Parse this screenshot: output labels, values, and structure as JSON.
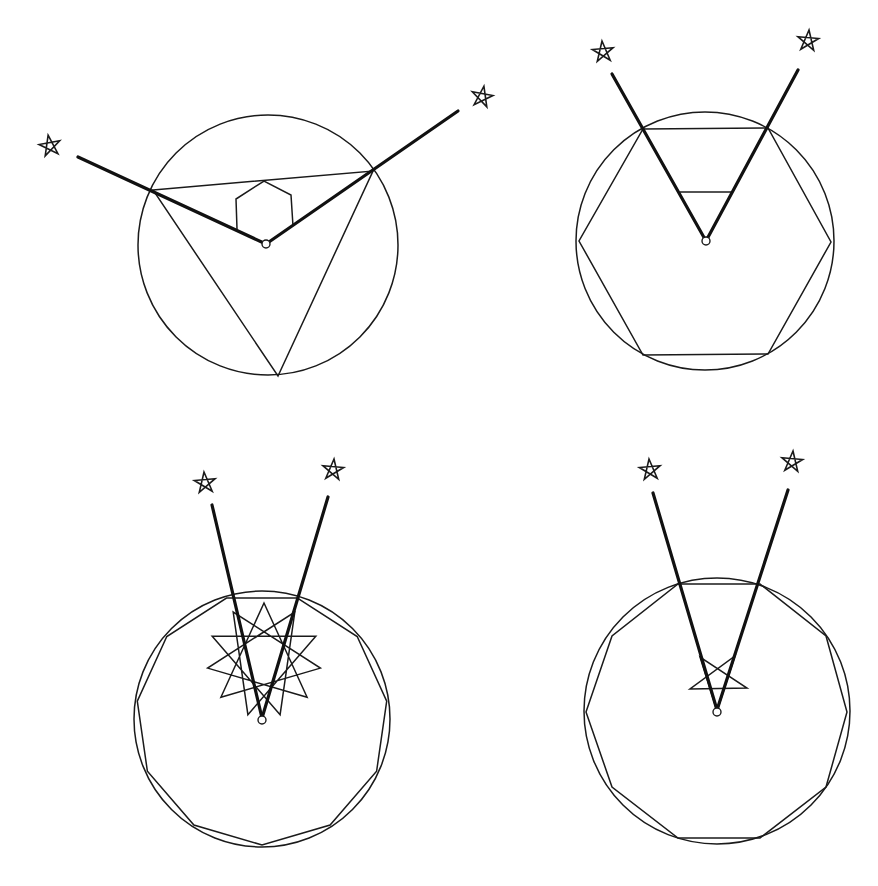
{
  "figure": {
    "colors": {
      "ink": "#1a1a1a",
      "background": "#ffffff"
    },
    "panels": [
      {
        "id": "top-left",
        "circle": {
          "cx": 268,
          "cy": 245,
          "r": 130
        },
        "inscribed_polygon": {
          "sides": 3,
          "points": [
            [
              153,
              190
            ],
            [
              373,
              171
            ],
            [
              278,
              376
            ]
          ]
        },
        "inner_figure": {
          "type": "hexagon-partial",
          "points": [
            [
              237,
              229
            ],
            [
              236,
              199
            ],
            [
              264,
              181
            ],
            [
              291,
              195
            ],
            [
              293,
              226
            ]
          ]
        },
        "center_point": {
          "cx": 266,
          "cy": 244,
          "r": 4
        },
        "rays": [
          {
            "from": [
              266,
              244
            ],
            "to": [
              78,
              157
            ]
          },
          {
            "from": [
              266,
              244
            ],
            "to": [
              458,
              111
            ]
          }
        ],
        "stars": [
          {
            "cx": 50,
            "cy": 146,
            "r": 11,
            "rotation": -100
          },
          {
            "cx": 482,
            "cy": 97,
            "r": 11,
            "rotation": -80
          }
        ]
      },
      {
        "id": "top-right",
        "circle": {
          "cx": 705,
          "cy": 241,
          "r": 129
        },
        "inscribed_polygon": {
          "sides": 6,
          "points": [
            [
              643,
              129
            ],
            [
              768,
              128
            ],
            [
              831,
              242
            ],
            [
              768,
              354
            ],
            [
              643,
              355
            ],
            [
              579,
              241
            ]
          ]
        },
        "inner_figure": {
          "type": "segment",
          "points": [
            [
              680,
              192
            ],
            [
              733,
              192
            ]
          ]
        },
        "center_point": {
          "cx": 706,
          "cy": 241,
          "r": 4
        },
        "rays": [
          {
            "from": [
              706,
              241
            ],
            "to": [
              612,
              74
            ]
          },
          {
            "from": [
              706,
              241
            ],
            "to": [
              798,
              70
            ]
          }
        ],
        "stars": [
          {
            "cx": 603,
            "cy": 52,
            "r": 11,
            "rotation": -95
          },
          {
            "cx": 808,
            "cy": 41,
            "r": 11,
            "rotation": -85
          }
        ]
      },
      {
        "id": "bottom-left",
        "circle": {
          "cx": 262,
          "cy": 719,
          "r": 128
        },
        "inscribed_polygon": {
          "sides": 11,
          "r": 126,
          "rotation_deg": -90,
          "flat_top": true
        },
        "inner_figure": {
          "type": "star-polygon",
          "notation": "{11/4}",
          "cx": 264,
          "cy": 660,
          "r": 57
        },
        "center_point": {
          "cx": 262,
          "cy": 720,
          "r": 4
        },
        "rays": [
          {
            "from": [
              262,
              718
            ],
            "to": [
              212,
              505
            ]
          },
          {
            "from": [
              262,
              718
            ],
            "to": [
              328,
              497
            ]
          }
        ],
        "stars": [
          {
            "cx": 205,
            "cy": 483,
            "r": 11,
            "rotation": -95
          },
          {
            "cx": 333,
            "cy": 470,
            "r": 11,
            "rotation": -85
          }
        ]
      },
      {
        "id": "bottom-right",
        "circle": {
          "cx": 717,
          "cy": 711,
          "r": 133
        },
        "inscribed_polygon": {
          "sides": 10,
          "points": [
            [
              678,
              584
            ],
            [
              760,
              584
            ],
            [
              826,
              636
            ],
            [
              847,
              712
            ],
            [
              826,
              787
            ],
            [
              760,
              838
            ],
            [
              678,
              838
            ],
            [
              612,
              787
            ],
            [
              586,
              712
            ],
            [
              612,
              636
            ]
          ]
        },
        "inner_figure": {
          "type": "pentagram-inverted",
          "points": [
            [
              690,
              689
            ],
            [
              747,
              688
            ],
            [
              700,
              657
            ],
            [
              717,
              711
            ],
            [
              735,
              656
            ]
          ]
        },
        "center_point": {
          "cx": 717,
          "cy": 712,
          "r": 4
        },
        "rays": [
          {
            "from": [
              717,
              710
            ],
            "to": [
              653,
              493
            ]
          },
          {
            "from": [
              717,
              710
            ],
            "to": [
              788,
              490
            ]
          }
        ],
        "stars": [
          {
            "cx": 650,
            "cy": 470,
            "r": 11,
            "rotation": -95
          },
          {
            "cx": 792,
            "cy": 462,
            "r": 11,
            "rotation": -85
          }
        ]
      }
    ]
  }
}
